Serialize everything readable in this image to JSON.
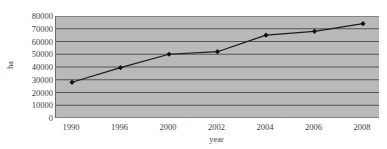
{
  "chart_data": {
    "type": "line",
    "title": "",
    "subtitle": "",
    "xlabel": "year",
    "ylabel": "ha",
    "categories": [
      "1990",
      "1996",
      "2000",
      "2002",
      "2004",
      "2006",
      "2008"
    ],
    "x": [
      1990,
      1996,
      2000,
      2002,
      2004,
      2006,
      2008
    ],
    "values": [
      28000,
      39500,
      50000,
      52000,
      65000,
      68000,
      74000
    ],
    "series": [
      {
        "name": "ha",
        "values": [
          28000,
          39500,
          50000,
          52000,
          65000,
          68000,
          74000
        ]
      }
    ],
    "ylim": [
      0,
      80000
    ],
    "ytick_labels": [
      "80000",
      "70000",
      "60000",
      "50000",
      "40000",
      "30000",
      "20000",
      "10000",
      "0"
    ],
    "ytick_values": [
      80000,
      70000,
      60000,
      50000,
      40000,
      30000,
      20000,
      10000,
      0
    ],
    "grid": true,
    "grid_axis": "y",
    "legend": false,
    "legend_position": "none",
    "marker": "diamond",
    "annotations": []
  },
  "style": {
    "plot_background": "#b9b9b9",
    "page_background": "#ffffff",
    "gridline_color": "#4a4a4a",
    "line_color": "#1a1a1a",
    "marker_color": "#101010",
    "axis_color": "#6d6d6d",
    "text_color": "#3f3f3f"
  },
  "icons": {
    "data_point": "diamond-marker-icon"
  }
}
